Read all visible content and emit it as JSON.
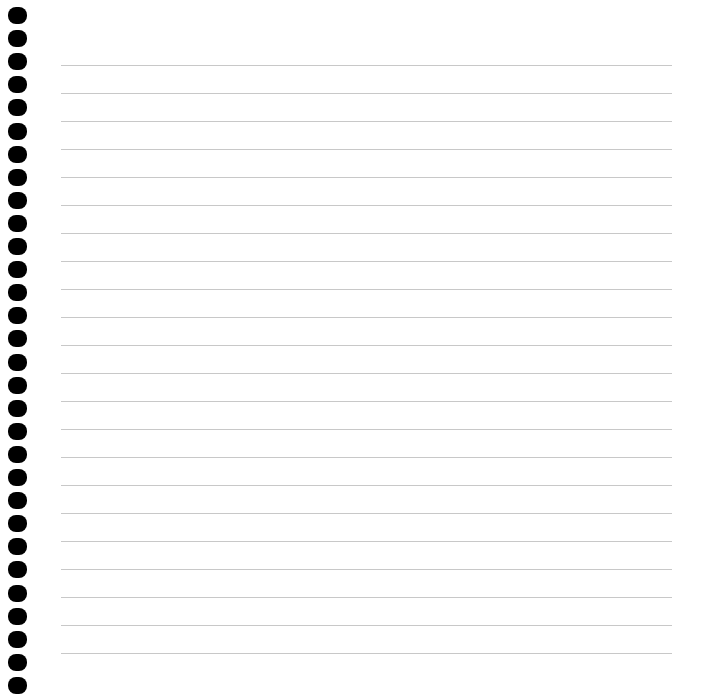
{
  "page": {
    "type": "blank-lined-notebook-page",
    "background": "#ffffff",
    "rule_color": "#c8c8c8",
    "hole_color": "#000000",
    "hole_count": 30,
    "line_count": 22
  }
}
